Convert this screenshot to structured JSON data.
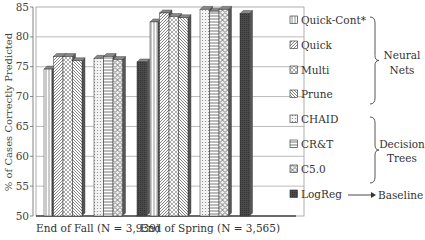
{
  "chart_data": {
    "type": "bar",
    "title": "",
    "xlabel": "",
    "ylabel": "% of Cases Correctly Predicted",
    "ylim": [
      50,
      85
    ],
    "yticks": [
      50,
      55,
      60,
      65,
      70,
      75,
      80,
      85
    ],
    "grid": true,
    "legend_position": "right",
    "categories": [
      "End of Fall (N = 3,939)",
      "End of Spring (N = 3,565)"
    ],
    "series": [
      {
        "name": "Quick-Cont*",
        "group": "Neural Nets",
        "pattern": "vlines",
        "values": [
          74.6,
          82.5
        ]
      },
      {
        "name": "Quick",
        "group": "Neural Nets",
        "pattern": "diag",
        "values": [
          76.7,
          84.0
        ]
      },
      {
        "name": "Multi",
        "group": "Neural Nets",
        "pattern": "cross",
        "values": [
          76.7,
          83.4
        ]
      },
      {
        "name": "Prune",
        "group": "Neural Nets",
        "pattern": "diag2",
        "values": [
          76.0,
          83.2
        ]
      },
      {
        "name": "CHAID",
        "group": "Decision Trees",
        "pattern": "dots",
        "values": [
          76.4,
          84.6
        ]
      },
      {
        "name": "CR&T",
        "group": "Decision Trees",
        "pattern": "hlines",
        "values": [
          76.7,
          84.3
        ]
      },
      {
        "name": "C5.0",
        "group": "Decision Trees",
        "pattern": "checker",
        "values": [
          76.2,
          84.6
        ]
      },
      {
        "name": "LogReg",
        "group": "Baseline",
        "pattern": "solid-dark",
        "values": [
          75.8,
          83.9
        ]
      }
    ],
    "annotations": [
      {
        "text": "Neural Nets",
        "brackets": [
          "Quick-Cont*",
          "Quick",
          "Multi",
          "Prune"
        ]
      },
      {
        "text": "Decision Trees",
        "brackets": [
          "CHAID",
          "CR&T",
          "C5.0"
        ]
      },
      {
        "text": "Baseline",
        "arrow_from": "LogReg"
      }
    ]
  },
  "legend": {
    "items": [
      "Quick-Cont*",
      "Quick",
      "Multi",
      "Prune",
      "CHAID",
      "CR&T",
      "C5.0",
      "LogReg"
    ],
    "groups": {
      "neural": [
        "Neural",
        "Nets"
      ],
      "trees": [
        "Decision",
        "Trees"
      ],
      "baseline": "Baseline"
    }
  }
}
